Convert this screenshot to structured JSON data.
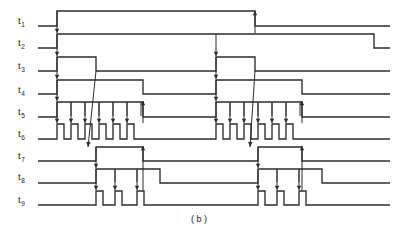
{
  "figure": {
    "caption": "( b )",
    "kind": "timing-diagram",
    "background": "#ffffff",
    "line_color": "#2b2b2b",
    "width": 399,
    "height": 232
  },
  "signals": [
    {
      "base": "t",
      "sub": "1",
      "label": "t1",
      "row_y": 20
    },
    {
      "base": "t",
      "sub": "2",
      "label": "t2",
      "row_y": 42
    },
    {
      "base": "t",
      "sub": "3",
      "label": "t3",
      "row_y": 65
    },
    {
      "base": "t",
      "sub": "4",
      "label": "t4",
      "row_y": 89
    },
    {
      "base": "t",
      "sub": "5",
      "label": "t5",
      "row_y": 111
    },
    {
      "base": "t",
      "sub": "6",
      "label": "t6",
      "row_y": 133
    },
    {
      "base": "t",
      "sub": "7",
      "label": "t7",
      "row_y": 155
    },
    {
      "base": "t",
      "sub": "8",
      "label": "t8",
      "row_y": 176
    },
    {
      "base": "t",
      "sub": "9",
      "label": "t9",
      "row_y": 199
    }
  ],
  "chart_data": {
    "type": "line",
    "title": "",
    "xlabel": "",
    "ylabel": "",
    "x_range": [
      38,
      390
    ],
    "series": [
      {
        "name": "t1",
        "baseline_y": 26,
        "high_y": 11,
        "transitions": [
          {
            "x": 57,
            "edge": "rise"
          },
          {
            "x": 255,
            "edge": "fall"
          }
        ]
      },
      {
        "name": "t2",
        "baseline_y": 48,
        "high_y": 34,
        "transitions": [
          {
            "x": 57,
            "edge": "rise"
          },
          {
            "x": 374,
            "edge": "fall"
          }
        ]
      },
      {
        "name": "t3",
        "baseline_y": 71,
        "high_y": 57,
        "transitions": [
          {
            "x": 57,
            "edge": "rise"
          },
          {
            "x": 96,
            "edge": "fall"
          },
          {
            "x": 216,
            "edge": "rise"
          },
          {
            "x": 255,
            "edge": "fall"
          }
        ]
      },
      {
        "name": "t4",
        "baseline_y": 94,
        "high_y": 80,
        "transitions": [
          {
            "x": 57,
            "edge": "rise"
          },
          {
            "x": 143,
            "edge": "fall"
          },
          {
            "x": 216,
            "edge": "rise"
          },
          {
            "x": 302,
            "edge": "fall"
          }
        ]
      },
      {
        "name": "t5",
        "baseline_y": 117,
        "high_y": 102,
        "transitions": [
          {
            "x": 57,
            "edge": "rise"
          },
          {
            "x": 143,
            "edge": "fall"
          },
          {
            "x": 216,
            "edge": "rise"
          },
          {
            "x": 302,
            "edge": "fall"
          }
        ],
        "tick_marks_x": [
          71,
          85,
          99,
          113,
          127,
          141,
          230,
          244,
          258,
          272,
          286,
          300
        ]
      },
      {
        "name": "t6",
        "baseline_y": 139,
        "high_y": 124,
        "pulse_count": 12,
        "pulses": [
          {
            "start": 57,
            "end": 64
          },
          {
            "start": 71,
            "end": 78
          },
          {
            "start": 85,
            "end": 92
          },
          {
            "start": 99,
            "end": 106
          },
          {
            "start": 113,
            "end": 120
          },
          {
            "start": 127,
            "end": 134
          },
          {
            "start": 216,
            "end": 223
          },
          {
            "start": 230,
            "end": 237
          },
          {
            "start": 244,
            "end": 251
          },
          {
            "start": 258,
            "end": 265
          },
          {
            "start": 272,
            "end": 279
          },
          {
            "start": 286,
            "end": 293
          }
        ]
      },
      {
        "name": "t7",
        "baseline_y": 161,
        "high_y": 147,
        "transitions": [
          {
            "x": 96,
            "edge": "rise"
          },
          {
            "x": 143,
            "edge": "fall"
          },
          {
            "x": 258,
            "edge": "rise"
          },
          {
            "x": 302,
            "edge": "fall"
          }
        ]
      },
      {
        "name": "t8",
        "baseline_y": 183,
        "high_y": 169,
        "transitions": [
          {
            "x": 96,
            "edge": "rise"
          },
          {
            "x": 160,
            "edge": "fall"
          },
          {
            "x": 258,
            "edge": "rise"
          },
          {
            "x": 322,
            "edge": "fall"
          }
        ],
        "tick_marks_x": [
          115,
          137,
          277,
          299
        ]
      },
      {
        "name": "t9",
        "baseline_y": 205,
        "high_y": 191,
        "pulse_count": 6,
        "pulses": [
          {
            "start": 96,
            "end": 103
          },
          {
            "start": 115,
            "end": 122
          },
          {
            "start": 137,
            "end": 144
          },
          {
            "start": 258,
            "end": 265
          },
          {
            "start": 277,
            "end": 284
          },
          {
            "start": 299,
            "end": 306
          }
        ]
      }
    ],
    "causal_arrows": [
      {
        "from": "t1-rise",
        "to": "t2",
        "x": 57,
        "y1": 11,
        "y2": 33,
        "dir": "down"
      },
      {
        "from": "t2-rise",
        "to": "t3",
        "x": 57,
        "y1": 34,
        "y2": 56,
        "dir": "down"
      },
      {
        "from": "t3-rise",
        "to": "t4",
        "x": 57,
        "y1": 57,
        "y2": 79,
        "dir": "down"
      },
      {
        "from": "t4-rise",
        "to": "t5",
        "x": 57,
        "y1": 80,
        "y2": 101,
        "dir": "down"
      },
      {
        "from": "t5-rise",
        "to": "t6",
        "x": 57,
        "y1": 102,
        "y2": 123,
        "dir": "down"
      },
      {
        "from": "t5-tick",
        "to": "t6",
        "x": 71,
        "y1": 103,
        "y2": 123,
        "dir": "down"
      },
      {
        "from": "t5-tick",
        "to": "t6",
        "x": 85,
        "y1": 103,
        "y2": 123,
        "dir": "down"
      },
      {
        "from": "t5-tick",
        "to": "t6",
        "x": 99,
        "y1": 103,
        "y2": 123,
        "dir": "down"
      },
      {
        "from": "t5-tick",
        "to": "t6",
        "x": 113,
        "y1": 103,
        "y2": 123,
        "dir": "down"
      },
      {
        "from": "t5-tick",
        "to": "t6",
        "x": 127,
        "y1": 103,
        "y2": 123,
        "dir": "down"
      },
      {
        "from": "t6-count",
        "to": "t5-fall",
        "x": 143,
        "y1": 123,
        "y2": 101,
        "dir": "up"
      },
      {
        "from": "t2-mid",
        "to": "t3-rise",
        "x": 216,
        "y1": 34,
        "y2": 56,
        "dir": "down"
      },
      {
        "from": "t3-rise2",
        "to": "t4",
        "x": 216,
        "y1": 57,
        "y2": 79,
        "dir": "down"
      },
      {
        "from": "t4-rise2",
        "to": "t5",
        "x": 216,
        "y1": 80,
        "y2": 101,
        "dir": "down"
      },
      {
        "from": "t5-rise2",
        "to": "t6",
        "x": 216,
        "y1": 102,
        "y2": 123,
        "dir": "down"
      },
      {
        "from": "t5-tick",
        "to": "t6",
        "x": 230,
        "y1": 103,
        "y2": 123,
        "dir": "down"
      },
      {
        "from": "t5-tick",
        "to": "t6",
        "x": 244,
        "y1": 103,
        "y2": 123,
        "dir": "down"
      },
      {
        "from": "t5-tick",
        "to": "t6",
        "x": 258,
        "y1": 103,
        "y2": 123,
        "dir": "down"
      },
      {
        "from": "t5-tick",
        "to": "t6",
        "x": 272,
        "y1": 103,
        "y2": 123,
        "dir": "down"
      },
      {
        "from": "t5-tick",
        "to": "t6",
        "x": 286,
        "y1": 103,
        "y2": 123,
        "dir": "down"
      },
      {
        "from": "t6-count2",
        "to": "t5-fall2",
        "x": 302,
        "y1": 123,
        "y2": 101,
        "dir": "up"
      },
      {
        "from": "t1-fall",
        "to": "up",
        "x": 255,
        "y1": 33,
        "y2": 11,
        "dir": "up"
      },
      {
        "from": "t7-rise",
        "to": "t8",
        "x": 96,
        "y1": 147,
        "y2": 168,
        "dir": "down"
      },
      {
        "from": "t8-rise",
        "to": "t9",
        "x": 96,
        "y1": 169,
        "y2": 190,
        "dir": "down"
      },
      {
        "from": "t8-tick",
        "to": "t9",
        "x": 115,
        "y1": 170,
        "y2": 190,
        "dir": "down"
      },
      {
        "from": "t8-tick",
        "to": "t9",
        "x": 137,
        "y1": 170,
        "y2": 190,
        "dir": "down"
      },
      {
        "from": "t9-end",
        "to": "t7-fall",
        "x": 143,
        "y1": 190,
        "y2": 146,
        "dir": "up"
      },
      {
        "from": "t7-rise2",
        "to": "t8",
        "x": 258,
        "y1": 147,
        "y2": 168,
        "dir": "down"
      },
      {
        "from": "t8-rise2",
        "to": "t9",
        "x": 258,
        "y1": 169,
        "y2": 190,
        "dir": "down"
      },
      {
        "from": "t8-tick",
        "to": "t9",
        "x": 277,
        "y1": 170,
        "y2": 190,
        "dir": "down"
      },
      {
        "from": "t8-tick",
        "to": "t9",
        "x": 299,
        "y1": 170,
        "y2": 190,
        "dir": "down"
      },
      {
        "from": "t9-end2",
        "to": "t7-fall2",
        "x": 302,
        "y1": 190,
        "y2": 146,
        "dir": "up"
      }
    ],
    "diagonal_links": [
      {
        "from_x": 96,
        "from_y": 71,
        "to_x": 88,
        "to_y": 147,
        "note": "t3 fall to t7 rise"
      },
      {
        "from_x": 255,
        "from_y": 71,
        "to_x": 250,
        "to_y": 147,
        "note": "t3 fall2 to t7 rise2"
      }
    ]
  }
}
